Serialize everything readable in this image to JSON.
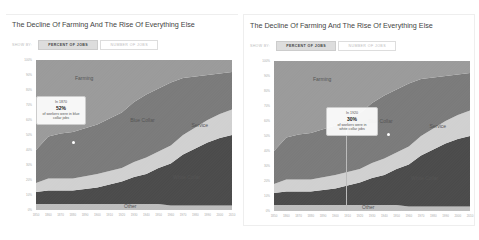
{
  "panels": [
    {
      "title": "The Decline Of Farming And The Rise Of Everything Else",
      "controls": {
        "show_by": "SHOW BY:",
        "tabs": [
          {
            "label": "PERCENT OF JOBS",
            "active": true
          },
          {
            "label": "NUMBER OF JOBS",
            "active": false
          }
        ]
      },
      "tooltip": {
        "year_line": "In 1870",
        "value": "52%",
        "desc1": "of workers were in blue",
        "desc2": "collar jobs"
      }
    },
    {
      "title": "The Decline Of Farming And The Rise Of Everything Else",
      "controls": {
        "show_by": "SHOW BY:",
        "tabs": [
          {
            "label": "PERCENT OF JOBS",
            "active": true
          },
          {
            "label": "NUMBER OF JOBS",
            "active": false
          }
        ]
      },
      "tooltip": {
        "year_line": "In 1920",
        "value": "30%",
        "desc1": "of workers were in",
        "desc2": "white collar jobs"
      }
    }
  ],
  "chart_data": {
    "type": "area",
    "stacked": true,
    "title": "The Decline Of Farming And The Rise Of Everything Else",
    "x": [
      1850,
      1860,
      1870,
      1880,
      1900,
      1910,
      1920,
      1930,
      1940,
      1950,
      1960,
      1970,
      1980,
      1990,
      2000,
      2010
    ],
    "x_ticks": [
      "1850",
      "1860",
      "1870",
      "1880",
      "1890",
      "1900",
      "1910",
      "1920",
      "1930",
      "1940",
      "1950",
      "1960",
      "1970",
      "1980",
      "1990",
      "2000",
      "2010"
    ],
    "y_ticks": [
      "0%",
      "10%",
      "20%",
      "30%",
      "40%",
      "50%",
      "60%",
      "70%",
      "80%",
      "90%",
      "100%"
    ],
    "ylim": [
      0,
      100
    ],
    "series": [
      {
        "name": "Other",
        "color": "#bdbdbd",
        "values": [
          4,
          4,
          4,
          4,
          4,
          4,
          4,
          4,
          4,
          4,
          3,
          3,
          3,
          3,
          3,
          3
        ]
      },
      {
        "name": "White Collar",
        "color": "#4a4a4a",
        "values": [
          8,
          9,
          9,
          9,
          11,
          13,
          15,
          18,
          20,
          24,
          28,
          34,
          38,
          42,
          45,
          47
        ]
      },
      {
        "name": "Service",
        "color": "#d0d0d0",
        "values": [
          6,
          8,
          8,
          8,
          9,
          9,
          9,
          10,
          11,
          11,
          12,
          13,
          14,
          15,
          16,
          17
        ]
      },
      {
        "name": "Blue Collar",
        "color": "#7a7a7a",
        "values": [
          22,
          28,
          30,
          31,
          33,
          35,
          37,
          40,
          42,
          42,
          42,
          38,
          34,
          30,
          27,
          25
        ]
      },
      {
        "name": "Farming",
        "color": "#9a9a9a",
        "values": [
          60,
          51,
          49,
          48,
          43,
          39,
          35,
          28,
          23,
          19,
          15,
          12,
          11,
          10,
          9,
          8
        ]
      }
    ],
    "annotations": [
      {
        "panel": 0,
        "text": "In 1870 52% of workers were in blue collar jobs"
      },
      {
        "panel": 1,
        "text": "In 1920 30% of workers were in white collar jobs"
      }
    ],
    "legend": "inline area labels",
    "grid": false
  }
}
